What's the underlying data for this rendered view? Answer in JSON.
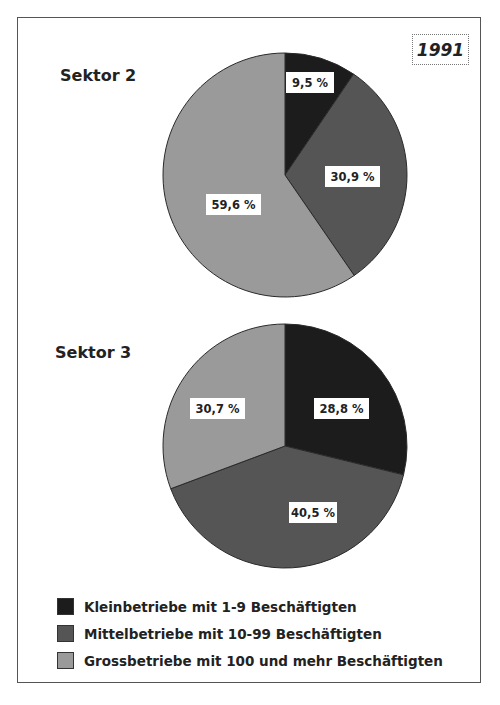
{
  "year": "1991",
  "charts": [
    {
      "title": "Sektor 2"
    },
    {
      "title": "Sektor 3"
    }
  ],
  "legend": [
    {
      "label": "Kleinbetriebe mit 1-9 Beschäftigten",
      "color": "#1c1c1c"
    },
    {
      "label": "Mittelbetriebe mit 10-99 Beschäftigten",
      "color": "#555555"
    },
    {
      "label": "Grossbetriebe mit 100 und mehr Beschäftigten",
      "color": "#9a9a9a"
    }
  ],
  "chart_data": [
    {
      "type": "pie",
      "title": "Sektor 2",
      "subtitle": "1991",
      "categories": [
        "Kleinbetriebe mit 1-9 Beschäftigten",
        "Mittelbetriebe mit 10-99 Beschäftigten",
        "Grossbetriebe mit 100 und mehr Beschäftigten"
      ],
      "values": [
        9.5,
        30.9,
        59.6
      ],
      "labels": [
        "9,5 %",
        "30,9 %",
        "59,6 %"
      ],
      "legend_position": "bottom"
    },
    {
      "type": "pie",
      "title": "Sektor 3",
      "subtitle": "1991",
      "categories": [
        "Kleinbetriebe mit 1-9 Beschäftigten",
        "Mittelbetriebe mit 10-99 Beschäftigten",
        "Grossbetriebe mit 100 und mehr Beschäftigten"
      ],
      "values": [
        28.8,
        40.5,
        30.7
      ],
      "labels": [
        "28,8 %",
        "40,5 %",
        "30,7 %"
      ],
      "legend_position": "bottom"
    }
  ]
}
